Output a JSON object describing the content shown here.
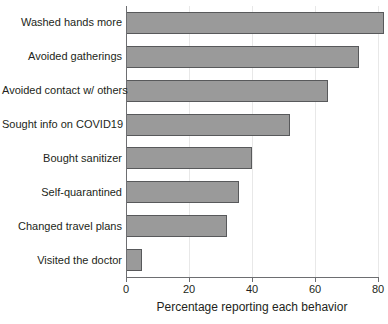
{
  "chart_data": {
    "type": "bar",
    "orientation": "horizontal",
    "title": "",
    "xlabel": "Percentage reporting each behavior",
    "ylabel": "",
    "xlim": [
      0,
      80
    ],
    "ylim": null,
    "grid": true,
    "legend": null,
    "categories": [
      "Washed hands more",
      "Avoided gatherings",
      "Avoided contact w/ others",
      "Sought info on COVID19",
      "Bought sanitizer",
      "Self-quarantined",
      "Changed travel plans",
      "Visited the doctor"
    ],
    "values": [
      82,
      74,
      64,
      52,
      40,
      36,
      32,
      5
    ],
    "xticks": [
      0,
      20,
      40,
      60,
      80
    ],
    "xtick_labels": [
      "0",
      "20",
      "40",
      "60",
      "80"
    ],
    "bar_fill_color": "#9a9a9a",
    "bar_edge_color": "#58595b",
    "axis_color": "#6d6e71",
    "gridline_color": "#e8e8e8",
    "background_color": "#ffffff"
  }
}
